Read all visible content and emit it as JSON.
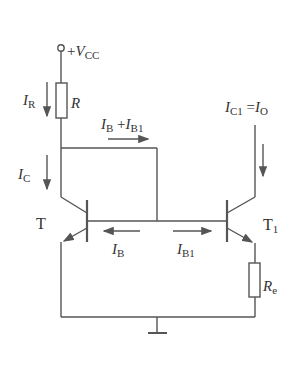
{
  "diagram": {
    "supply": {
      "label_plus": "+",
      "label_main": "V",
      "label_sub": "CC"
    },
    "resistor_r": {
      "label": "R"
    },
    "resistor_re": {
      "label_main": "R",
      "label_sub": "e"
    },
    "transistor_left": {
      "label": "T"
    },
    "transistor_right": {
      "label_main": "T",
      "label_sub": "1"
    },
    "currents": {
      "ir": {
        "main": "I",
        "sub": "R"
      },
      "ic": {
        "main": "I",
        "sub": "C"
      },
      "ib_plus_ib1": {
        "main1": "I",
        "sub1": "B",
        "plus": " +",
        "main2": "I",
        "sub2": "B1"
      },
      "ic1_eq_io": {
        "main1": "I",
        "sub1": "C1",
        "eq": " =",
        "main2": "I",
        "sub2": "O"
      },
      "ib": {
        "main": "I",
        "sub": "B"
      },
      "ib1": {
        "main": "I",
        "sub": "B1"
      }
    },
    "colors": {
      "line": "#555555",
      "text": "#333333",
      "background": "#ffffff"
    }
  }
}
